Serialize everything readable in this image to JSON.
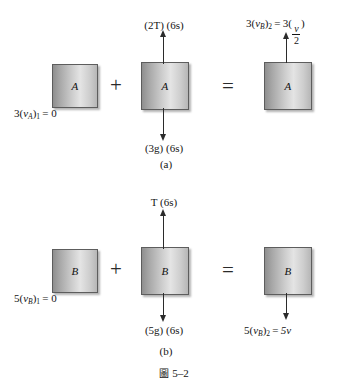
{
  "figure": {
    "caption_symbol": "圖",
    "caption_number": "5–2"
  },
  "rows": [
    {
      "id": "a",
      "caption": "(a)",
      "block_label": "A",
      "left_label": "3(vA)1= 0",
      "top_force_label": "(2T) (6s)",
      "bottom_force_label": "(3g) (6s)",
      "result_label": "3(vB)2 = 3( v/2 )",
      "plus": "+",
      "equals": "="
    },
    {
      "id": "b",
      "caption": "(b)",
      "block_label": "B",
      "left_label": "5(vB)1= 0",
      "top_force_label": "T (6s)",
      "bottom_force_label": "(5g) (6s)",
      "result_label": "5(vB)2 = 5v",
      "plus": "+",
      "equals": "="
    }
  ],
  "tokens": {
    "three": "3",
    "five": "5",
    "v": "v",
    "sub_A": "A",
    "sub_B": "B",
    "sub_1": "1",
    "sub_2": "2",
    "eq_zero": "= 0",
    "eq": "=",
    "open_paren": "(",
    "close_paren": ")",
    "two": "2",
    "five_v": "5v",
    "two_T_6s": "(2T) (6s)",
    "T_6s": "T (6s)",
    "three_g_6s": "(3g) (6s)",
    "five_g_6s": "(5g) (6s)"
  },
  "colors": {
    "block_border": "#5d5d5d",
    "arrow": "#2b2b2b",
    "text": "#141414",
    "background": "#ffffff"
  }
}
